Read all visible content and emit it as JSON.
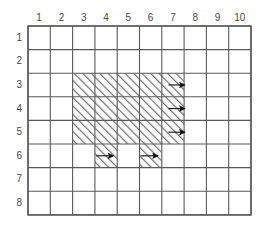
{
  "figure": {
    "title": "",
    "type": "grid-diagram",
    "grid": {
      "columns": 10,
      "rows": 8,
      "column_labels": [
        "1",
        "2",
        "3",
        "4",
        "5",
        "6",
        "7",
        "8",
        "9",
        "10"
      ],
      "row_labels": [
        "1",
        "2",
        "3",
        "4",
        "5",
        "6",
        "7",
        "8"
      ],
      "line_color": "#5a5a5a",
      "border_color": "#555555",
      "background_color": "#ffffff",
      "origin_x": 28,
      "origin_y": 26,
      "cell_width": 22.3,
      "cell_height": 23.6
    },
    "shaded_region": {
      "fill_pattern": "diagonal-hatch",
      "hatch_color": "#6f6f6f",
      "hatch_background": "#ffffff",
      "cells": [
        {
          "col": 3,
          "row": 3
        },
        {
          "col": 4,
          "row": 3
        },
        {
          "col": 5,
          "row": 3
        },
        {
          "col": 6,
          "row": 3
        },
        {
          "col": 7,
          "row": 3
        },
        {
          "col": 3,
          "row": 4
        },
        {
          "col": 4,
          "row": 4
        },
        {
          "col": 5,
          "row": 4
        },
        {
          "col": 6,
          "row": 4
        },
        {
          "col": 7,
          "row": 4
        },
        {
          "col": 3,
          "row": 5
        },
        {
          "col": 4,
          "row": 5
        },
        {
          "col": 5,
          "row": 5
        },
        {
          "col": 6,
          "row": 5
        },
        {
          "col": 7,
          "row": 5
        },
        {
          "col": 4,
          "row": 6
        },
        {
          "col": 6,
          "row": 6
        }
      ]
    },
    "arrows": {
      "color": "#111111",
      "direction": "right",
      "items": [
        {
          "col": 7,
          "row": 3,
          "position": "right-edge"
        },
        {
          "col": 7,
          "row": 4,
          "position": "right-edge"
        },
        {
          "col": 7,
          "row": 5,
          "position": "right-edge"
        },
        {
          "col": 4,
          "row": 6,
          "position": "in-cell"
        },
        {
          "col": 6,
          "row": 6,
          "position": "in-cell"
        }
      ]
    }
  }
}
